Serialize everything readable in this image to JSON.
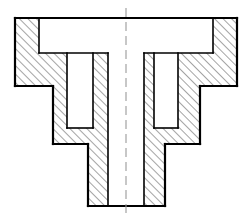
{
  "canvas": {
    "width": 246,
    "height": 221,
    "background": "#ffffff"
  },
  "drawing": {
    "title": "Sectional view of a stepped rotationally-symmetric part",
    "type": "engineering-section-view",
    "projection": "full-section",
    "symmetry_axis_x": 126,
    "line_color": "#000000",
    "hatch_color": "#1a1a1a",
    "centerline_color": "#9a9a9a",
    "outline_stroke_width": 2.2,
    "inner_stroke_width": 1.6,
    "hatch_stroke_width": 0.8,
    "hatch_spacing": 6,
    "hatch_angle_deg": 45,
    "centerline": {
      "x": 126,
      "y_top": 8,
      "y_bottom": 215,
      "dash": "9 5"
    },
    "outer_profile": [
      [
        15,
        18
      ],
      [
        237,
        18
      ],
      [
        237,
        86
      ],
      [
        200,
        86
      ],
      [
        200,
        144
      ],
      [
        165,
        144
      ],
      [
        165,
        206
      ],
      [
        88,
        206
      ],
      [
        88,
        144
      ],
      [
        53,
        144
      ],
      [
        53,
        86
      ],
      [
        15,
        86
      ]
    ],
    "voids": [
      {
        "name": "top-counterbore-cavity",
        "points": [
          [
            39,
            18
          ],
          [
            213,
            18
          ],
          [
            213,
            53
          ],
          [
            39,
            53
          ]
        ]
      },
      {
        "name": "central-through-bore",
        "points": [
          [
            108,
            53
          ],
          [
            144,
            53
          ],
          [
            144,
            206
          ],
          [
            108,
            206
          ]
        ]
      },
      {
        "name": "left-annular-groove",
        "points": [
          [
            67,
            53
          ],
          [
            93,
            53
          ],
          [
            93,
            128
          ],
          [
            67,
            128
          ]
        ]
      },
      {
        "name": "right-annular-groove",
        "points": [
          [
            154,
            53
          ],
          [
            178,
            53
          ],
          [
            178,
            128
          ],
          [
            154,
            128
          ]
        ]
      }
    ],
    "hatched_regions": [
      {
        "name": "left-flange-web",
        "points": [
          [
            15,
            18
          ],
          [
            39,
            18
          ],
          [
            39,
            53
          ],
          [
            53,
            53
          ],
          [
            53,
            144
          ],
          [
            88,
            144
          ],
          [
            88,
            206
          ],
          [
            108,
            206
          ],
          [
            108,
            53
          ],
          [
            93,
            53
          ],
          [
            93,
            128
          ],
          [
            67,
            128
          ],
          [
            67,
            53
          ],
          [
            53,
            53
          ],
          [
            53,
            86
          ],
          [
            15,
            86
          ]
        ]
      },
      {
        "name": "right-flange-web",
        "points": [
          [
            237,
            18
          ],
          [
            213,
            18
          ],
          [
            213,
            53
          ],
          [
            200,
            53
          ],
          [
            200,
            144
          ],
          [
            165,
            144
          ],
          [
            165,
            206
          ],
          [
            144,
            206
          ],
          [
            144,
            53
          ],
          [
            154,
            53
          ],
          [
            154,
            128
          ],
          [
            178,
            128
          ],
          [
            178,
            53
          ],
          [
            200,
            53
          ],
          [
            200,
            86
          ],
          [
            237,
            86
          ]
        ]
      }
    ],
    "edges": [
      {
        "name": "flange-top-edge",
        "x1": 15,
        "y1": 18,
        "x2": 237,
        "y2": 18
      },
      {
        "name": "flange-left-outer-edge",
        "x1": 15,
        "y1": 18,
        "x2": 15,
        "y2": 86
      },
      {
        "name": "flange-right-outer-edge",
        "x1": 237,
        "y1": 18,
        "x2": 237,
        "y2": 86
      },
      {
        "name": "flange-left-under-face",
        "x1": 15,
        "y1": 86,
        "x2": 53,
        "y2": 86
      },
      {
        "name": "flange-right-under-face",
        "x1": 200,
        "y1": 86,
        "x2": 237,
        "y2": 86
      },
      {
        "name": "mid-body-left-edge",
        "x1": 53,
        "y1": 86,
        "x2": 53,
        "y2": 144
      },
      {
        "name": "mid-body-right-edge",
        "x1": 200,
        "y1": 86,
        "x2": 200,
        "y2": 144
      },
      {
        "name": "mid-body-left-under-face",
        "x1": 53,
        "y1": 144,
        "x2": 88,
        "y2": 144
      },
      {
        "name": "mid-body-right-under-face",
        "x1": 165,
        "y1": 144,
        "x2": 200,
        "y2": 144
      },
      {
        "name": "stem-left-edge",
        "x1": 88,
        "y1": 144,
        "x2": 88,
        "y2": 206
      },
      {
        "name": "stem-right-edge",
        "x1": 165,
        "y1": 144,
        "x2": 165,
        "y2": 206
      },
      {
        "name": "stem-bottom-edge",
        "x1": 88,
        "y1": 206,
        "x2": 165,
        "y2": 206
      },
      {
        "name": "cavity-left-wall",
        "x1": 39,
        "y1": 18,
        "x2": 39,
        "y2": 53
      },
      {
        "name": "cavity-right-wall",
        "x1": 213,
        "y1": 18,
        "x2": 213,
        "y2": 53
      },
      {
        "name": "cavity-floor-left",
        "x1": 39,
        "y1": 53,
        "x2": 108,
        "y2": 53
      },
      {
        "name": "cavity-floor-right",
        "x1": 144,
        "y1": 53,
        "x2": 213,
        "y2": 53
      },
      {
        "name": "bore-left-wall",
        "x1": 108,
        "y1": 53,
        "x2": 108,
        "y2": 206
      },
      {
        "name": "bore-right-wall",
        "x1": 144,
        "y1": 53,
        "x2": 144,
        "y2": 206
      },
      {
        "name": "left-groove-outer-wall",
        "x1": 67,
        "y1": 53,
        "x2": 67,
        "y2": 128
      },
      {
        "name": "left-groove-inner-wall",
        "x1": 93,
        "y1": 53,
        "x2": 93,
        "y2": 128
      },
      {
        "name": "left-groove-floor",
        "x1": 67,
        "y1": 128,
        "x2": 93,
        "y2": 128
      },
      {
        "name": "right-groove-inner-wall",
        "x1": 154,
        "y1": 53,
        "x2": 154,
        "y2": 128
      },
      {
        "name": "right-groove-outer-wall",
        "x1": 178,
        "y1": 53,
        "x2": 178,
        "y2": 128
      },
      {
        "name": "right-groove-floor",
        "x1": 154,
        "y1": 128,
        "x2": 178,
        "y2": 128
      }
    ]
  }
}
